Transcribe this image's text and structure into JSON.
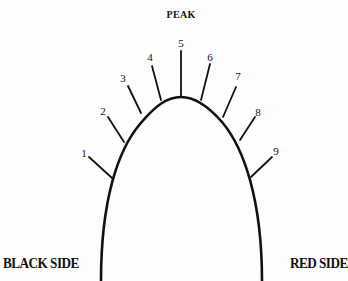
{
  "diagram": {
    "title": "PEAK",
    "left_label": "BLACK SIDE",
    "right_label": "RED SIDE",
    "line_color": "#111111",
    "curve": {
      "apex": [
        181,
        97
      ],
      "bottom_left": [
        101,
        281
      ],
      "bottom_right": [
        262,
        281
      ]
    },
    "ticks": [
      {
        "label": "1",
        "label_pos": [
          84,
          153
        ],
        "from": [
          89,
          157
        ],
        "to": [
          112,
          178
        ]
      },
      {
        "label": "2",
        "label_pos": [
          103,
          111
        ],
        "from": [
          108,
          117
        ],
        "to": [
          124,
          142
        ]
      },
      {
        "label": "3",
        "label_pos": [
          123,
          78
        ],
        "from": [
          128,
          86
        ],
        "to": [
          141,
          113
        ]
      },
      {
        "label": "4",
        "label_pos": [
          150,
          57
        ],
        "from": [
          152,
          66
        ],
        "to": [
          161,
          100
        ]
      },
      {
        "label": "5",
        "label_pos": [
          181,
          43
        ],
        "from": [
          181,
          51
        ],
        "to": [
          181,
          97
        ]
      },
      {
        "label": "6",
        "label_pos": [
          210,
          57
        ],
        "from": [
          210,
          64
        ],
        "to": [
          201,
          100
        ]
      },
      {
        "label": "7",
        "label_pos": [
          238,
          76
        ],
        "from": [
          236,
          87
        ],
        "to": [
          223,
          117
        ]
      },
      {
        "label": "8",
        "label_pos": [
          258,
          112
        ],
        "from": [
          255,
          117
        ],
        "to": [
          240,
          140
        ]
      },
      {
        "label": "9",
        "label_pos": [
          276,
          151
        ],
        "from": [
          272,
          157
        ],
        "to": [
          251,
          177
        ]
      }
    ]
  }
}
